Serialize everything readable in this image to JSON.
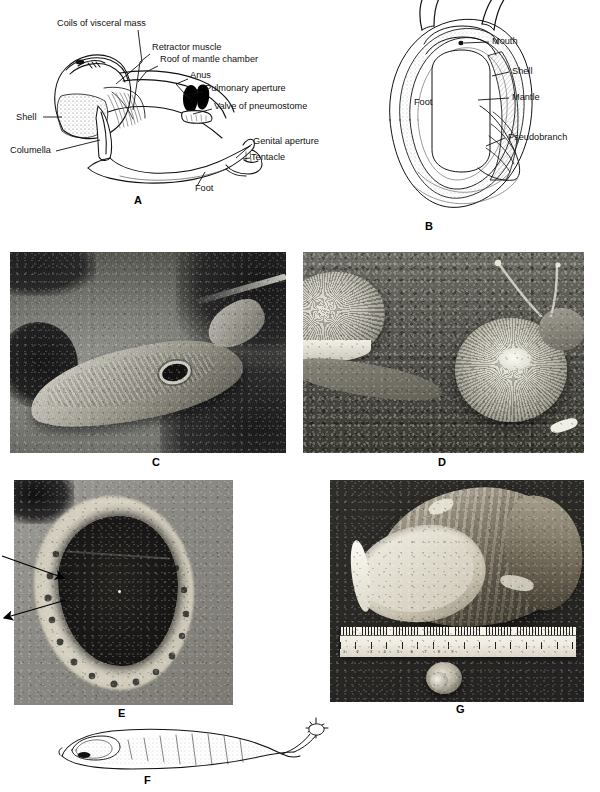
{
  "figure": {
    "type": "scientific-plate",
    "background": "#ffffff",
    "ink": "#111111"
  },
  "panels": [
    {
      "id": "A",
      "letter": "A",
      "kind": "line-drawing",
      "caption_subject": "Dissected pulmonate snail showing mantle chamber and pneumostome",
      "labels": [
        {
          "text": "Coils of visceral mass",
          "x": 57,
          "y": 24,
          "anchor": "start"
        },
        {
          "text": "Retractor muscle",
          "x": 152,
          "y": 48,
          "anchor": "start"
        },
        {
          "text": "Roof of mantle chamber",
          "x": 160,
          "y": 60,
          "anchor": "start"
        },
        {
          "text": "Anus",
          "x": 190,
          "y": 75,
          "anchor": "start"
        },
        {
          "text": "Pulmonary aperture",
          "x": 205,
          "y": 88,
          "anchor": "start"
        },
        {
          "text": "Valve of pneumostome",
          "x": 214,
          "y": 106,
          "anchor": "start"
        },
        {
          "text": "Shell",
          "x": 18,
          "y": 118,
          "anchor": "start"
        },
        {
          "text": "Columella",
          "x": 12,
          "y": 151,
          "anchor": "start"
        },
        {
          "text": "Genital aperture",
          "x": 253,
          "y": 141,
          "anchor": "start"
        },
        {
          "text": "Tentacle",
          "x": 251,
          "y": 157,
          "anchor": "start"
        },
        {
          "text": "Foot",
          "x": 195,
          "y": 189,
          "anchor": "start"
        }
      ]
    },
    {
      "id": "B",
      "letter": "B",
      "kind": "line-drawing",
      "caption_subject": "Ventral view of snail showing foot, mantle and pseudobranch",
      "labels": [
        {
          "text": "Mouth",
          "x": 492,
          "y": 39,
          "anchor": "start"
        },
        {
          "text": "Shell",
          "x": 512,
          "y": 70,
          "anchor": "start"
        },
        {
          "text": "Mantle",
          "x": 512,
          "y": 96,
          "anchor": "start"
        },
        {
          "text": "Foot",
          "x": 414,
          "y": 101,
          "anchor": "start"
        },
        {
          "text": "Pseudobranch",
          "x": 508,
          "y": 136,
          "anchor": "start"
        }
      ]
    },
    {
      "id": "C",
      "letter": "C",
      "kind": "photograph",
      "caption_subject": "Slug on rock surface, pneumostome visible",
      "rect": {
        "x": 10,
        "y": 252,
        "w": 276,
        "h": 201
      }
    },
    {
      "id": "D",
      "letter": "D",
      "kind": "photograph",
      "caption_subject": "Two land snails on soil, one with extended tentacles",
      "rect": {
        "x": 303,
        "y": 252,
        "w": 281,
        "h": 201
      }
    },
    {
      "id": "E",
      "letter": "E",
      "kind": "photograph",
      "caption_subject": "Limpet-like shell, arrows indicate marginal features",
      "rect": {
        "x": 14,
        "y": 480,
        "w": 219,
        "h": 225
      },
      "annotations": [
        {
          "type": "arrow",
          "name": "arrow-upper",
          "x1": 2,
          "y1": 556,
          "x2": 57,
          "y2": 575
        },
        {
          "type": "arrow",
          "name": "arrow-lower",
          "x1": 54,
          "y1": 600,
          "x2": 6,
          "y2": 616
        }
      ]
    },
    {
      "id": "F",
      "letter": "F",
      "kind": "line-drawing",
      "caption_subject": "Lateral view of a slug with internal shell outline",
      "rect": {
        "x": 55,
        "y": 718,
        "w": 260,
        "h": 56
      }
    },
    {
      "id": "G",
      "letter": "G",
      "kind": "photograph",
      "caption_subject": "Giant African land snail shell beside a ruler with a small juvenile shell",
      "rect": {
        "x": 330,
        "y": 480,
        "w": 254,
        "h": 222
      },
      "ruler": {
        "present": true,
        "unit": "cm",
        "ticks": [
          "1",
          "2",
          "3",
          "4",
          "5",
          "6",
          "7",
          "8",
          "9",
          "10",
          "11",
          "12",
          "13",
          "14",
          "15"
        ]
      }
    }
  ],
  "panel_letters": [
    {
      "label": "A",
      "x": 134,
      "y": 196
    },
    {
      "label": "B",
      "x": 425,
      "y": 222
    },
    {
      "label": "C",
      "x": 152,
      "y": 458
    },
    {
      "label": "D",
      "x": 438,
      "y": 458
    },
    {
      "label": "E",
      "x": 118,
      "y": 708
    },
    {
      "label": "F",
      "x": 144,
      "y": 775
    },
    {
      "label": "G",
      "x": 456,
      "y": 704
    }
  ]
}
